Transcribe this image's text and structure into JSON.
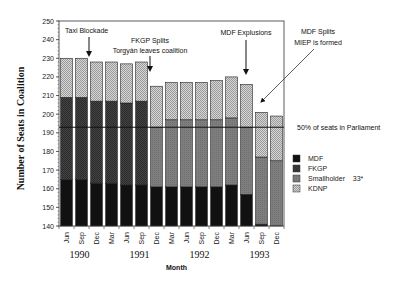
{
  "chart_data": {
    "type": "bar",
    "stacked": true,
    "title": "",
    "xlabel": "Month",
    "ylabel": "Number of Seats in Coalition",
    "ylim": [
      140,
      250
    ],
    "yticks": [
      140,
      150,
      160,
      170,
      180,
      190,
      200,
      210,
      220,
      230,
      240,
      250
    ],
    "categories": [
      "Jun",
      "Sep",
      "Dec",
      "Mar",
      "Jun",
      "Sep",
      "Dec",
      "Mar",
      "Jun",
      "Sep",
      "Dec",
      "Mar",
      "Jun",
      "Sep",
      "Dec"
    ],
    "years": [
      {
        "label": "1990",
        "center_index": 1
      },
      {
        "label": "1991",
        "center_index": 5
      },
      {
        "label": "1992",
        "center_index": 9
      },
      {
        "label": "1993",
        "center_index": 13
      }
    ],
    "series": [
      {
        "name": "MDF",
        "color": "#111111",
        "values": [
          165,
          165,
          163,
          163,
          162,
          162,
          161,
          161,
          161,
          161,
          161,
          162,
          157,
          141,
          140
        ]
      },
      {
        "name": "FKGP",
        "color": "#3a3a3a",
        "values": [
          44,
          44,
          44,
          44,
          44,
          45,
          0,
          0,
          0,
          0,
          0,
          0,
          0,
          0,
          0
        ]
      },
      {
        "name": "Smallholder 33*",
        "color": "#7a7a7a",
        "values": [
          0,
          0,
          0,
          0,
          0,
          0,
          32,
          36,
          36,
          36,
          36,
          36,
          36,
          36,
          35
        ]
      },
      {
        "name": "KDNP",
        "color": "#bdbdbd",
        "values": [
          21,
          21,
          21,
          21,
          21,
          21,
          22,
          20,
          20,
          20,
          21,
          22,
          23,
          24,
          24
        ]
      }
    ],
    "totals": [
      230,
      230,
      228,
      228,
      227,
      228,
      215,
      217,
      217,
      217,
      218,
      220,
      216,
      201,
      199
    ],
    "reference_line": {
      "value": 193,
      "label": "50% of seats in Parliament"
    },
    "annotations": [
      {
        "text": [
          "Taxi Blockade"
        ],
        "arrow_to_index": 1.5
      },
      {
        "text": [
          "FKGP Splits",
          "Torgyán leaves coalition"
        ],
        "arrow_to_index": 5.5
      },
      {
        "text": [
          "MDF Explusions"
        ],
        "arrow_to_index": 12
      },
      {
        "text": [
          "MDF Splits",
          "MIEP is formed"
        ],
        "arrow_to_index": 13
      }
    ],
    "legend_position": "right",
    "grid": false
  },
  "legend": {
    "items": [
      {
        "label": "MDF",
        "color": "#111111"
      },
      {
        "label": "FKGP",
        "color": "#3a3a3a"
      },
      {
        "label": "Smallholder    33*",
        "color": "#7a7a7a"
      },
      {
        "label": "KDNP",
        "color": "#bdbdbd"
      }
    ]
  }
}
